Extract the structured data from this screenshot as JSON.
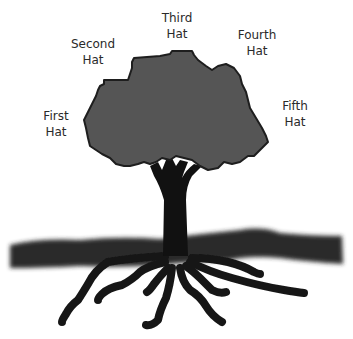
{
  "diagram": {
    "type": "tree-metaphor",
    "colors": {
      "background": "#ffffff",
      "canopy": "#555555",
      "canopy_outline": "#1e1e1e",
      "trunk": "#111111",
      "ground": "#2b2b2b",
      "roots": "#151515",
      "label_text": "#2a2a2a"
    },
    "labels": [
      {
        "line1": "First",
        "line2": "Hat"
      },
      {
        "line1": "Second",
        "line2": "Hat"
      },
      {
        "line1": "Third",
        "line2": "Hat"
      },
      {
        "line1": "Fourth",
        "line2": "Hat"
      },
      {
        "line1": "Fifth",
        "line2": "Hat"
      }
    ],
    "elements": [
      "canopy",
      "trunk",
      "ground",
      "roots"
    ]
  }
}
